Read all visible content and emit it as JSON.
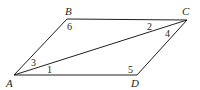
{
  "diagram": {
    "type": "parallelogram-with-diagonal",
    "vertices": {
      "A": {
        "label": "A",
        "x": 14,
        "y": 75
      },
      "B": {
        "label": "B",
        "x": 67,
        "y": 19
      },
      "C": {
        "label": "C",
        "x": 187,
        "y": 20
      },
      "D": {
        "label": "D",
        "x": 137,
        "y": 75
      }
    },
    "edges": [
      "AB",
      "BC",
      "CD",
      "DA",
      "AC"
    ],
    "angle_labels": {
      "a1": "1",
      "a2": "2",
      "a3": "3",
      "a4": "4",
      "a5": "5",
      "a6": "6"
    },
    "colors": {
      "stroke": "#231f20",
      "background": "#ffffff"
    }
  }
}
